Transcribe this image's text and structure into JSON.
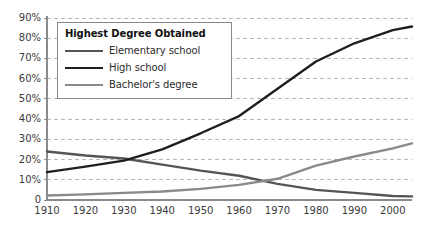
{
  "chart_data": {
    "type": "line",
    "title": "",
    "xlabel": "",
    "ylabel": "",
    "xlim": [
      1910,
      2005
    ],
    "ylim": [
      0,
      90
    ],
    "grid": true,
    "grid_axis": "y",
    "legend_position": "upper-left-inside",
    "legend_title": "Highest Degree Obtained",
    "x_ticks": [
      "1910",
      "1920",
      "1930",
      "1940",
      "1950",
      "1960",
      "1970",
      "1980",
      "1990",
      "2000"
    ],
    "x_tick_values": [
      1910,
      1920,
      1930,
      1940,
      1950,
      1960,
      1970,
      1980,
      1990,
      2000
    ],
    "y_ticks": [
      "0",
      "10%",
      "20%",
      "30%",
      "40%",
      "50%",
      "60%",
      "70%",
      "80%",
      "90%"
    ],
    "y_tick_values": [
      0,
      10,
      20,
      30,
      40,
      50,
      60,
      70,
      80,
      90
    ],
    "x": [
      1910,
      1920,
      1930,
      1940,
      1950,
      1960,
      1970,
      1980,
      1990,
      2000,
      2005
    ],
    "series": [
      {
        "name": "Elementary school",
        "color": "#555555",
        "values": [
          24,
          22,
          20.5,
          17.5,
          14.5,
          12,
          8,
          5,
          3.5,
          2,
          1.8
        ]
      },
      {
        "name": "High school",
        "color": "#1f1f1f",
        "values": [
          13.8,
          16.5,
          19.5,
          25,
          33,
          41.5,
          55,
          68.5,
          77.5,
          84,
          85.8
        ]
      },
      {
        "name": "Bachelor's degree",
        "color": "#8a8a8a",
        "values": [
          2.2,
          2.8,
          3.5,
          4.2,
          5.5,
          7.5,
          10.5,
          17,
          21.5,
          25.5,
          28
        ]
      }
    ]
  },
  "legend": {
    "title": "Highest Degree Obtained",
    "entries": [
      {
        "label": "Elementary school",
        "color": "#555555"
      },
      {
        "label": "High school",
        "color": "#1f1f1f"
      },
      {
        "label": "Bachelor's degree",
        "color": "#8a8a8a"
      }
    ]
  },
  "axes": {
    "axis_color": "#8a8a8a",
    "grid_color": "#b8b8b8",
    "tick_label_color": "#3a3a3a"
  }
}
